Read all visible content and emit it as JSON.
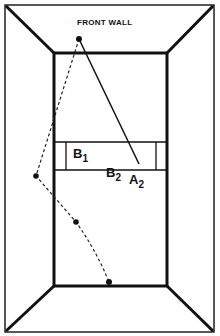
{
  "diagram": {
    "title": "FRONT WALL",
    "labels": [
      {
        "id": "B1",
        "base": "B",
        "sub": "1"
      },
      {
        "id": "B2",
        "base": "B",
        "sub": "2"
      },
      {
        "id": "A2",
        "base": "A",
        "sub": "2"
      }
    ],
    "colors": {
      "line": "#111111",
      "background": "#ffffff"
    },
    "geometry": {
      "outer_rect": [
        5,
        5,
        214,
        332
      ],
      "inner_rect": [
        54,
        53,
        167,
        286
      ],
      "service_box": {
        "top": 142,
        "bottom": 170,
        "left_line": 66,
        "right_line": 156
      },
      "solid_path": [
        [
          79,
          39
        ],
        [
          139,
          164
        ]
      ],
      "dashed_path_points": [
        [
          79,
          39
        ],
        [
          36,
          176
        ],
        [
          76,
          222
        ],
        [
          109,
          282
        ]
      ]
    }
  }
}
